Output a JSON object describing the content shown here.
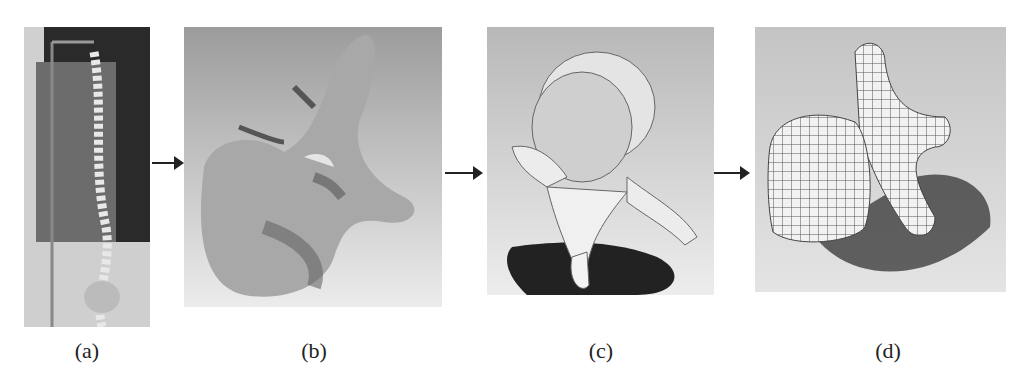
{
  "figure": {
    "panels": [
      {
        "id": "a",
        "label": "(a)",
        "content": "photo of spine model on stand"
      },
      {
        "id": "b",
        "label": "(b)",
        "content": "scanned vertebra mesh"
      },
      {
        "id": "c",
        "label": "(c)",
        "content": "smooth reconstructed vertebra surface"
      },
      {
        "id": "d",
        "label": "(d)",
        "content": "quad-mesh / NURBS gridded vertebra"
      }
    ],
    "arrows": [
      "a-to-b",
      "b-to-c",
      "c-to-d"
    ]
  }
}
